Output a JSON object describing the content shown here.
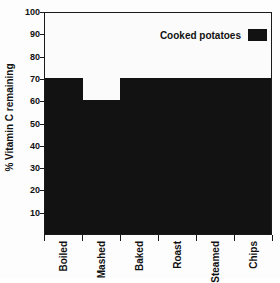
{
  "chart_data": {
    "type": "bar",
    "title": "",
    "subtitle": "",
    "xlabel": "",
    "ylabel": "% Vitamin C remaining",
    "categories": [
      "Boiled",
      "Mashed",
      "Baked",
      "Roast",
      "Steamed",
      "Chips"
    ],
    "values": [
      70,
      60,
      70,
      70,
      70,
      70
    ],
    "series": [
      {
        "name": "Cooked potatoes",
        "values": [
          70,
          60,
          70,
          70,
          70,
          70
        ],
        "color": "#121212"
      }
    ],
    "ylim": [
      0,
      100
    ],
    "y_ticks": [
      10,
      20,
      30,
      40,
      50,
      60,
      70,
      80,
      90,
      100
    ],
    "y_tick_labels": [
      "10",
      "20",
      "30",
      "40",
      "50",
      "60",
      "70",
      "80",
      "90",
      "100"
    ],
    "grid": false,
    "legend_position": "top-right",
    "bar_gap": 0,
    "annotations": []
  },
  "legend": {
    "label": "Cooked potatoes",
    "swatch_color": "#121212"
  },
  "axes": {
    "y_title": "% Vitamin C remaining",
    "y_max": 100,
    "y_min": 0,
    "frame_color": "#1a1a1a"
  },
  "colors": {
    "bar": "#121212",
    "background": "#fdfdfd",
    "plot_background": "#fbfbfb",
    "text": "#111111",
    "axis": "#1a1a1a"
  }
}
